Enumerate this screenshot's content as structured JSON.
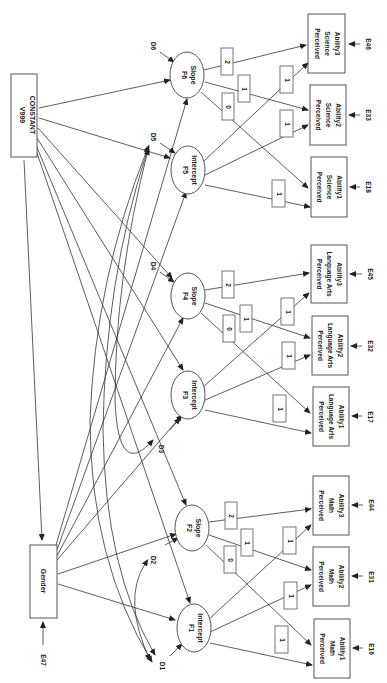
{
  "diagram": {
    "type": "latent growth path diagram (rotated 90°)",
    "constant": {
      "line1": "V999",
      "line2": "CONSTANT"
    },
    "gender": {
      "label": "Gender",
      "error": "E47"
    },
    "factors": [
      {
        "id": "F1",
        "label": "Intercept",
        "disturbance": "D1"
      },
      {
        "id": "F2",
        "label": "Slope",
        "disturbance": "D2"
      },
      {
        "id": "F3",
        "label": "Intercept",
        "disturbance": "D3"
      },
      {
        "id": "F4",
        "label": "Slope",
        "disturbance": "D4"
      },
      {
        "id": "F5",
        "label": "Intercept",
        "disturbance": "D5"
      },
      {
        "id": "F6",
        "label": "Slope",
        "disturbance": "D6"
      }
    ],
    "indicators": {
      "math": [
        {
          "line1": "Perceived",
          "line2": "Math",
          "line3": "Ability1",
          "error": "E16"
        },
        {
          "line1": "Perceived",
          "line2": "Math",
          "line3": "Ability2",
          "error": "E31"
        },
        {
          "line1": "Perceived",
          "line2": "Math",
          "line3": "Ability3",
          "error": "E44"
        }
      ],
      "language_arts": [
        {
          "line1": "Perceived",
          "line2": "Language Arts",
          "line3": "Ability1",
          "error": "E17"
        },
        {
          "line1": "Perceived",
          "line2": "Language Arts",
          "line3": "Ability2",
          "error": "E32"
        },
        {
          "line1": "Perceived",
          "line2": "Language Arts",
          "line3": "Ability3",
          "error": "E45"
        }
      ],
      "science": [
        {
          "line1": "Perceived",
          "line2": "Science",
          "line3": "Ability1",
          "error": "E18"
        },
        {
          "line1": "Perceived",
          "line2": "Science",
          "line3": "Ability2",
          "error": "E33"
        },
        {
          "line1": "Perceived",
          "line2": "Science",
          "line3": "Ability3",
          "error": "E46"
        }
      ]
    },
    "intercept_loadings": [
      "1",
      "1",
      "1"
    ],
    "slope_loadings": [
      "0",
      "1",
      "2"
    ]
  }
}
